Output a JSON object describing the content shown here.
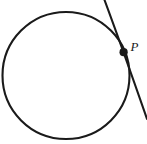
{
  "figure": {
    "kind": "geometry-diagram",
    "width": 147,
    "height": 144,
    "background_color": "#ffffff",
    "stroke_color": "#1a1a1a"
  },
  "labels": {
    "point_p": "P"
  },
  "geometry": {
    "circle": {
      "name": "circle",
      "center_x": 66,
      "center_y": 75.5,
      "radius": 63.5,
      "stroke_width": 2.1,
      "fill": "none"
    },
    "tangent_line": {
      "name": "tangent-line",
      "start_x": 104.5,
      "start_y": 0,
      "end_x": 147,
      "end_y": 119,
      "control_x": 123,
      "control_y": 50,
      "stroke_width": 2.1
    },
    "point_p": {
      "name": "point-p",
      "x": 123.6,
      "y": 52.2,
      "radius": 4.1,
      "fill": "#1a1a1a"
    },
    "point_p_label_position": {
      "x": 130.5,
      "y": 51
    }
  }
}
